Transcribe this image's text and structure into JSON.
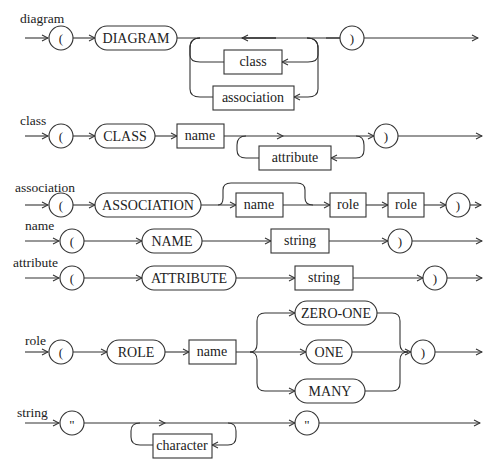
{
  "diagram": {
    "type": "syntax-railroad-diagram",
    "rules": [
      {
        "name": "diagram",
        "sequence": [
          "(",
          "DIAGRAM",
          "{ class | association }*",
          ")"
        ],
        "nodes": {
          "open": "(",
          "keyword": "DIAGRAM",
          "loop_a": "class",
          "loop_b": "association",
          "close": ")"
        }
      },
      {
        "name": "class",
        "sequence": [
          "(",
          "CLASS",
          "name",
          "{ attribute }*",
          ")"
        ],
        "nodes": {
          "open": "(",
          "keyword": "CLASS",
          "ref": "name",
          "loop": "attribute",
          "close": ")"
        }
      },
      {
        "name": "association",
        "sequence": [
          "(",
          "ASSOCIATION",
          "[ name ]",
          "role",
          "role",
          ")"
        ],
        "nodes": {
          "open": "(",
          "keyword": "ASSOCIATION",
          "optional": "name",
          "ref1": "role",
          "ref2": "role",
          "close": ")"
        }
      },
      {
        "name": "name",
        "sequence": [
          "(",
          "NAME",
          "string",
          ")"
        ],
        "nodes": {
          "open": "(",
          "keyword": "NAME",
          "ref": "string",
          "close": ")"
        }
      },
      {
        "name": "attribute",
        "sequence": [
          "(",
          "ATTRIBUTE",
          "string",
          ")"
        ],
        "nodes": {
          "open": "(",
          "keyword": "ATTRIBUTE",
          "ref": "string",
          "close": ")"
        }
      },
      {
        "name": "role",
        "sequence": [
          "(",
          "ROLE",
          "name",
          "ZERO-ONE | ONE | MANY",
          ")"
        ],
        "nodes": {
          "open": "(",
          "keyword": "ROLE",
          "ref": "name",
          "alt1": "ZERO-ONE",
          "alt2": "ONE",
          "alt3": "MANY",
          "close": ")"
        }
      },
      {
        "name": "string",
        "sequence": [
          "\"",
          "{ character }*",
          "\""
        ],
        "nodes": {
          "open": "\"",
          "loop": "character",
          "close": "\""
        }
      }
    ],
    "colors": {
      "stroke": "#333333",
      "text": "#222222",
      "background": "#ffffff"
    }
  }
}
